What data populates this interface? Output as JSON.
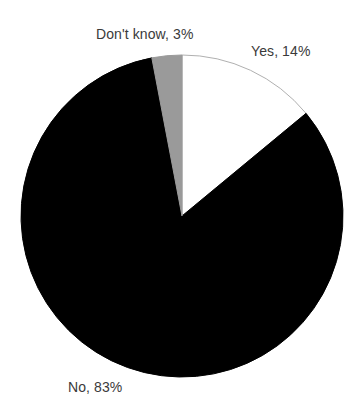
{
  "chart_data": {
    "type": "pie",
    "title": "",
    "subtitle": "",
    "xlabel": "",
    "ylabel": "",
    "grid": false,
    "legend_position": "none",
    "labels_position": "outside",
    "start_angle_deg": 0,
    "direction": "clockwise",
    "categories": [
      "Yes",
      "No",
      "Don't know"
    ],
    "values": [
      14,
      83,
      3
    ],
    "units": "%",
    "slices": [
      {
        "name": "Yes",
        "value": 14,
        "label": "Yes, 14%",
        "color": "#ffffff",
        "stroke": "#b0b0b0",
        "start_deg": 0,
        "end_deg": 50.4
      },
      {
        "name": "No",
        "value": 83,
        "label": "No, 83%",
        "color": "#000000",
        "stroke": "#000000",
        "start_deg": 50.4,
        "end_deg": 349.2
      },
      {
        "name": "Don't know",
        "value": 3,
        "label": "Don't know, 3%",
        "color": "#9a9a9a",
        "stroke": "#9a9a9a",
        "start_deg": 349.2,
        "end_deg": 360
      }
    ],
    "geometry": {
      "center_x": 182,
      "center_y": 216,
      "radius": 161
    },
    "colors": {
      "background": "#ffffff",
      "text": "#3a3a3a",
      "yes": "#ffffff",
      "no": "#000000",
      "dont_know": "#9a9a9a",
      "outline": "#b0b0b0"
    }
  }
}
